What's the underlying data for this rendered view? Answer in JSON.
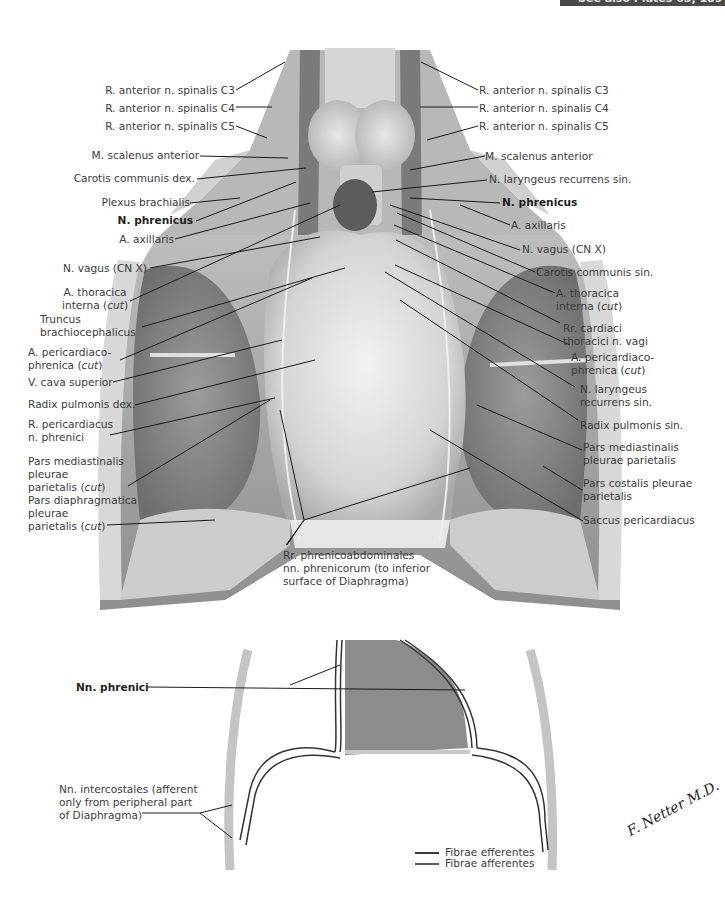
{
  "header": {
    "cross_reference": "See also Plates 63, 189"
  },
  "figure_top": {
    "title": "Phrenic nerve and pericardium (anterior view)",
    "labels_left": [
      {
        "id": "l1",
        "text": "R. anterior n. spinalis C3"
      },
      {
        "id": "l2",
        "text": "R. anterior n. spinalis C4"
      },
      {
        "id": "l3",
        "text": "R. anterior n. spinalis C5"
      },
      {
        "id": "l4",
        "text": "M. scalenus anterior"
      },
      {
        "id": "l5",
        "text": "Carotis communis dex."
      },
      {
        "id": "l6",
        "text": "Plexus brachialis"
      },
      {
        "id": "l7",
        "text": "N. phrenicus",
        "bold": true
      },
      {
        "id": "l8",
        "text": "A. axillaris"
      },
      {
        "id": "l9",
        "text": "N. vagus (CN X)"
      },
      {
        "id": "l10",
        "line1": "A. thoracica",
        "line2": "interna (",
        "italic": "cut",
        "close": ")"
      },
      {
        "id": "l11",
        "line1": "Truncus",
        "line2": "brachiocephalicus"
      },
      {
        "id": "l12",
        "line1": "A. pericardiaco-",
        "line2": "phrenica (",
        "italic": "cut",
        "close": ")"
      },
      {
        "id": "l13",
        "text": "V. cava superior"
      },
      {
        "id": "l14",
        "text": "Radix pulmonis dex."
      },
      {
        "id": "l15",
        "line1": "R. pericardiacus",
        "line2": "n. phrenici"
      },
      {
        "id": "l16",
        "line1": "Pars mediastinalis",
        "line2": "pleurae",
        "line3": "parietalis (",
        "italic": "cut",
        "close": ")"
      },
      {
        "id": "l17",
        "line1": "Pars diaphragmatica",
        "line2": "pleurae",
        "line3": "parietalis (",
        "italic": "cut",
        "close": ")"
      }
    ],
    "labels_right": [
      {
        "id": "r1",
        "text": "R. anterior n. spinalis C3"
      },
      {
        "id": "r2",
        "text": "R. anterior n. spinalis C4"
      },
      {
        "id": "r3",
        "text": "R. anterior n. spinalis C5"
      },
      {
        "id": "r4",
        "text": "M. scalenus anterior"
      },
      {
        "id": "r5",
        "text": "N. laryngeus recurrens sin."
      },
      {
        "id": "r6",
        "text": "N. phrenicus",
        "bold": true
      },
      {
        "id": "r7",
        "text": "A. axillaris"
      },
      {
        "id": "r8",
        "text": "N. vagus (CN X)"
      },
      {
        "id": "r9",
        "text": "Carotis communis sin."
      },
      {
        "id": "r10",
        "line1": "A. thoracica",
        "line2": "interna (",
        "italic": "cut",
        "close": ")"
      },
      {
        "id": "r11",
        "line1": "Rr. cardiaci",
        "line2": "thoracici n. vagi"
      },
      {
        "id": "r12",
        "line1": "A. pericardiaco-",
        "line2": "phrenica (",
        "italic": "cut",
        "close": ")"
      },
      {
        "id": "r13",
        "line1": "N. laryngeus",
        "line2": "recurrens sin."
      },
      {
        "id": "r14",
        "text": "Radix pulmonis sin."
      },
      {
        "id": "r15",
        "line1": "Pars mediastinalis",
        "line2": "pleurae parietalis"
      },
      {
        "id": "r16",
        "line1": "Pars costalis pleurae",
        "line2": "parietalis"
      },
      {
        "id": "r17",
        "text": "Saccus pericardiacus"
      }
    ],
    "label_bottom": {
      "line1": "Rr. phrenicoabdominales",
      "line2": "nn. phrenicorum (to inferior",
      "line3": "surface of Diaphragma)"
    }
  },
  "figure_bottom": {
    "title": "Schematic: innervation of diaphragm",
    "label_phrenici": "Nn. phrenici",
    "label_intercostales": {
      "line1": "Nn. intercostales (afferent",
      "line2": "only from peripheral part",
      "line3": "of Diaphragma)"
    },
    "legend": [
      {
        "label": "Fibrae efferentes",
        "color": "#3a3a3a"
      },
      {
        "label": "Fibrae afferentes",
        "color": "#5a5a5a"
      }
    ],
    "signature": "F. Netter M.D."
  },
  "colors": {
    "text": "#3b3b3b",
    "leader_line": "#1a1a1a",
    "illustration_mid": "#9a9a9a",
    "illustration_light": "#d8d8d8",
    "pericardium_schematic": "#8c8c8c",
    "rib_column": "#c4c4c4"
  }
}
